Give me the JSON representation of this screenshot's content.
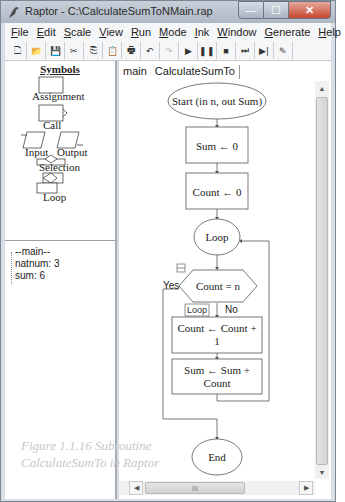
{
  "window": {
    "title": "Raptor - C:\\CalculateSumToNMain.rap",
    "controls": {
      "minimize": "—",
      "maximize": "☐",
      "close": "✕"
    }
  },
  "menubar": {
    "items": [
      {
        "label": "File",
        "accel": "F"
      },
      {
        "label": "Edit",
        "accel": "E"
      },
      {
        "label": "Scale",
        "accel": "S"
      },
      {
        "label": "View",
        "accel": "V"
      },
      {
        "label": "Run",
        "accel": "R"
      },
      {
        "label": "Mode",
        "accel": "M"
      },
      {
        "label": "Ink",
        "accel": "I"
      },
      {
        "label": "Window",
        "accel": "W"
      },
      {
        "label": "Generate",
        "accel": "G"
      },
      {
        "label": "Help",
        "accel": "H"
      }
    ]
  },
  "toolbar": {
    "buttons": [
      {
        "name": "new-file-icon",
        "glyph": "🗋"
      },
      {
        "name": "open-folder-icon",
        "glyph": "📂"
      },
      {
        "name": "save-icon",
        "glyph": "💾"
      },
      {
        "name": "cut-icon",
        "glyph": "✂"
      },
      {
        "name": "copy-icon",
        "glyph": "⎘"
      },
      {
        "name": "paste-icon",
        "glyph": "📋"
      },
      {
        "name": "print-icon",
        "glyph": "🖶"
      },
      {
        "name": "undo-icon",
        "glyph": "↶"
      },
      {
        "name": "redo-icon",
        "glyph": "↷"
      },
      {
        "name": "play-icon",
        "glyph": "▶"
      },
      {
        "name": "pause-icon",
        "glyph": "❚❚"
      },
      {
        "name": "stop-icon",
        "glyph": "■"
      },
      {
        "name": "step-icon",
        "glyph": "⏭"
      },
      {
        "name": "step-into-icon",
        "glyph": "▶|"
      },
      {
        "name": "pen-icon",
        "glyph": "✎"
      }
    ]
  },
  "symbols": {
    "title": "Symbols",
    "items": [
      "Assignment",
      "Call",
      "Input",
      "Output",
      "Selection",
      "Loop"
    ]
  },
  "variables": {
    "lines": [
      "--main--",
      "natnum: 3",
      "sum: 6"
    ]
  },
  "caption": {
    "line1": "Figure 1.1.16 Subroutine",
    "line2": "CalculateSumTo in Raptor"
  },
  "tabs": [
    {
      "label": "main",
      "active": false
    },
    {
      "label": "CalculateSumTo",
      "active": true
    }
  ],
  "flowchart": {
    "start": "Start (in n, out Sum)",
    "assign1": "Sum ← 0",
    "assign2": "Count ← 0",
    "loop": "Loop",
    "condition": "Count = n",
    "yes": "Yes",
    "no": "No",
    "loop_tag": "Loop",
    "assign3_line1": "Count ← Count  +",
    "assign3_line2": "1",
    "assign4_line1": "Sum ← Sum  +",
    "assign4_line2": "Count",
    "end": "End"
  },
  "scrollbars": {
    "vertical_grip": "≡",
    "horizontal_grip": "III"
  }
}
